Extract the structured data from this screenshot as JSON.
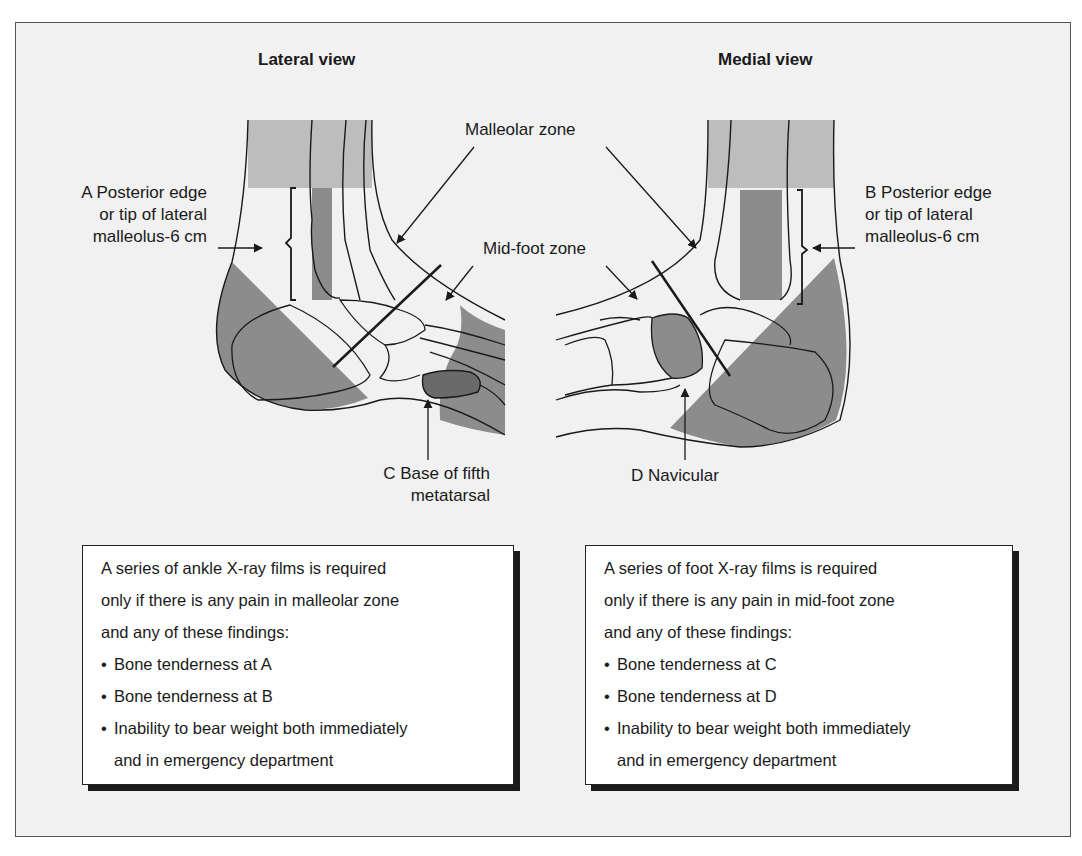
{
  "lateral": {
    "title": "Lateral view",
    "label_a": [
      "A Posterior edge",
      "or tip of lateral",
      "malleolus-6 cm"
    ],
    "label_c": [
      "C Base of fifth",
      "metatarsal"
    ]
  },
  "medial": {
    "title": "Medial view",
    "label_b": [
      "B Posterior edge",
      "or tip of lateral",
      "malleolus-6 cm"
    ],
    "label_d": "D Navicular"
  },
  "zones": {
    "malleolar": "Malleolar zone",
    "midfoot": "Mid-foot zone"
  },
  "ankle_box": {
    "intro": [
      "A series of ankle X-ray films is required",
      "only if there is any pain in malleolar zone",
      "and any of these findings:"
    ],
    "bullets": [
      "Bone tenderness at A",
      "Bone tenderness at B",
      "Inability to bear weight both immediately"
    ],
    "continuation": "and in emergency department"
  },
  "foot_box": {
    "intro": [
      "A series of foot X-ray films is required",
      "only if there is any pain in mid-foot zone",
      "and any of these findings:"
    ],
    "bullets": [
      "Bone tenderness at C",
      "Bone tenderness at D",
      "Inability to bear weight both immediately"
    ],
    "continuation": "and in emergency department"
  },
  "colors": {
    "light_gray": "#bdbdbd",
    "dark_gray": "#8c8c8c",
    "darker_gray": "#6a6a6a",
    "background": "#f1f1f1",
    "line": "#1a1a1a"
  }
}
